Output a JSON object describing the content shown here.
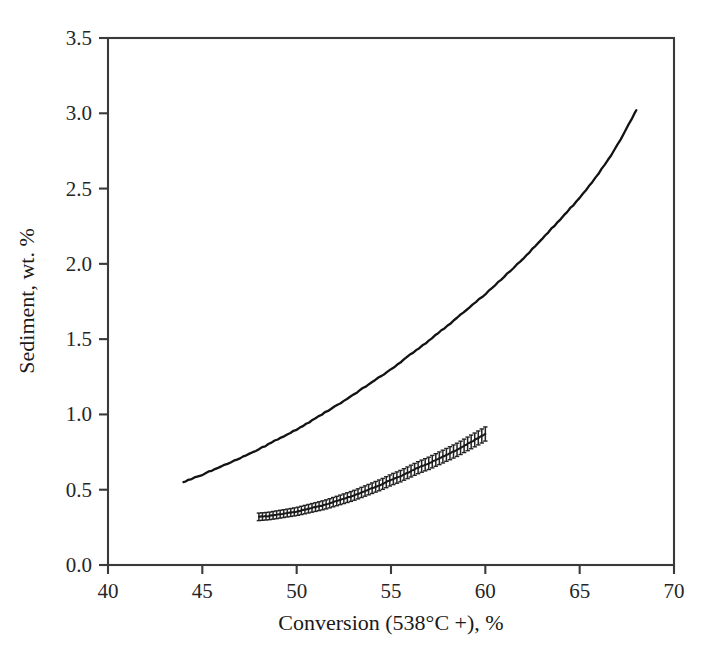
{
  "chart_data": {
    "type": "line",
    "title": "",
    "xlabel": "Conversion (538°C +), %",
    "ylabel": "Sediment, wt. %",
    "xlim": [
      40,
      70
    ],
    "ylim": [
      0.0,
      3.5
    ],
    "xticks": [
      40,
      45,
      50,
      55,
      60,
      65,
      70
    ],
    "xtick_labels": [
      "40",
      "45",
      "50",
      "55",
      "60",
      "65",
      "70"
    ],
    "yticks": [
      0.0,
      0.5,
      1.0,
      1.5,
      2.0,
      2.5,
      3.0,
      3.5
    ],
    "ytick_labels": [
      "0.0",
      "0.5",
      "1.0",
      "1.5",
      "2.0",
      "2.5",
      "3.0",
      "3.5"
    ],
    "grid": false,
    "legend": "none",
    "axis_frame": "box",
    "tick_direction": "out",
    "series": [
      {
        "name": "upper-curve",
        "style": "solid-line",
        "color": "#131313",
        "x": [
          44.0,
          45.0,
          46.0,
          47.0,
          48.0,
          49.0,
          50.0,
          51.0,
          52.0,
          53.0,
          54.0,
          55.0,
          56.0,
          57.0,
          58.0,
          59.0,
          60.0,
          61.0,
          62.0,
          63.0,
          64.0,
          65.0,
          66.0,
          67.0,
          68.0
        ],
        "y": [
          0.55,
          0.6,
          0.655,
          0.71,
          0.77,
          0.835,
          0.9,
          0.975,
          1.05,
          1.13,
          1.215,
          1.3,
          1.395,
          1.49,
          1.59,
          1.695,
          1.8,
          1.915,
          2.035,
          2.165,
          2.3,
          2.44,
          2.6,
          2.79,
          3.02
        ]
      },
      {
        "name": "lower-curve-with-error-bars",
        "style": "line-with-error-bars",
        "color": "#232323",
        "x": [
          48.0,
          48.5,
          49.0,
          49.5,
          50.0,
          50.5,
          51.0,
          51.5,
          52.0,
          52.5,
          53.0,
          53.5,
          54.0,
          54.5,
          55.0,
          55.5,
          56.0,
          56.5,
          57.0,
          57.5,
          58.0,
          58.5,
          59.0,
          59.5,
          60.0
        ],
        "y": [
          0.32,
          0.325,
          0.335,
          0.345,
          0.355,
          0.37,
          0.385,
          0.4,
          0.42,
          0.44,
          0.46,
          0.485,
          0.51,
          0.535,
          0.565,
          0.59,
          0.62,
          0.65,
          0.675,
          0.705,
          0.735,
          0.765,
          0.8,
          0.835,
          0.87
        ],
        "yerr": [
          0.025,
          0.025,
          0.026,
          0.026,
          0.027,
          0.028,
          0.029,
          0.03,
          0.031,
          0.032,
          0.033,
          0.034,
          0.035,
          0.036,
          0.037,
          0.038,
          0.039,
          0.04,
          0.041,
          0.042,
          0.043,
          0.044,
          0.045,
          0.046,
          0.047
        ]
      }
    ]
  }
}
